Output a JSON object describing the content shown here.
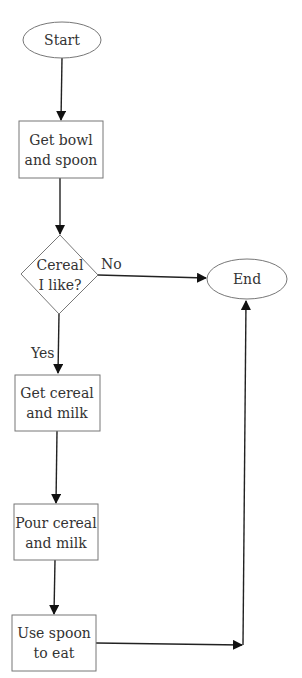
{
  "diagram": {
    "type": "flowchart",
    "nodes": {
      "start": {
        "shape": "ellipse",
        "label": "Start"
      },
      "get_bowl": {
        "shape": "rectangle",
        "line1": "Get bowl",
        "line2": "and spoon"
      },
      "decision": {
        "shape": "diamond",
        "line1": "Cereal",
        "line2": "I like?"
      },
      "end": {
        "shape": "ellipse",
        "label": "End"
      },
      "get_cereal": {
        "shape": "rectangle",
        "line1": "Get cereal",
        "line2": "and milk"
      },
      "pour": {
        "shape": "rectangle",
        "line1": "Pour cereal",
        "line2": "and milk"
      },
      "use_spoon": {
        "shape": "rectangle",
        "line1": "Use spoon",
        "line2": "to eat"
      }
    },
    "edges": {
      "no_label": "No",
      "yes_label": "Yes"
    },
    "edge_list": [
      {
        "from": "Start",
        "to": "Get bowl and spoon"
      },
      {
        "from": "Get bowl and spoon",
        "to": "Cereal I like?"
      },
      {
        "from": "Cereal I like?",
        "to": "End",
        "label": "No"
      },
      {
        "from": "Cereal I like?",
        "to": "Get cereal and milk",
        "label": "Yes"
      },
      {
        "from": "Get cereal and milk",
        "to": "Pour cereal and milk"
      },
      {
        "from": "Pour cereal and milk",
        "to": "Use spoon to eat"
      },
      {
        "from": "Use spoon to eat",
        "to": "End"
      }
    ]
  }
}
